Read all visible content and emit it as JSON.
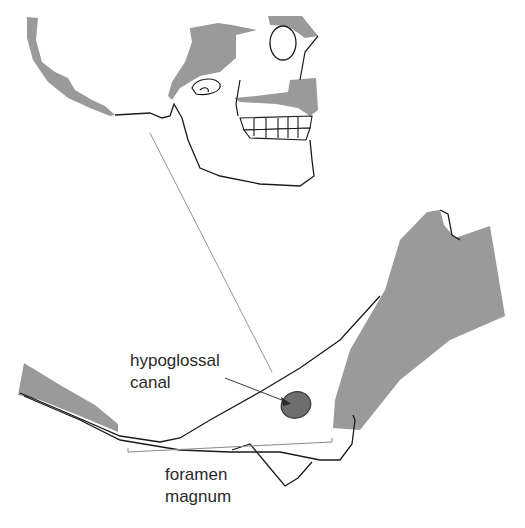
{
  "diagram": {
    "labels": {
      "hypoglossal_canal_line1": "hypoglossal",
      "hypoglossal_canal_line2": "canal",
      "foramen_magnum_line1": "foramen",
      "foramen_magnum_line2": "magnum"
    },
    "colors": {
      "bone_fill": "#9a9a9a",
      "canal_fill": "#6e6e6e",
      "outline": "#1a1a1a",
      "leader_line": "#888888"
    }
  }
}
